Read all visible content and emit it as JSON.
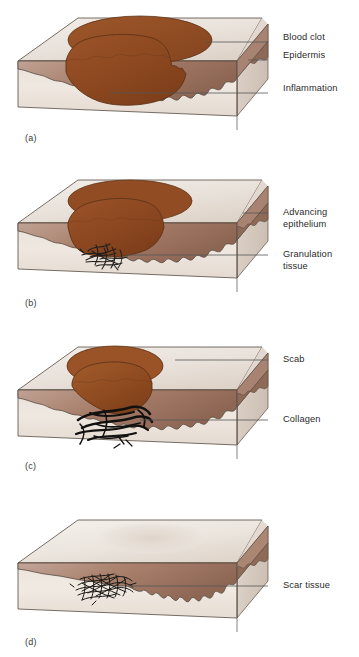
{
  "figure": {
    "width": 359,
    "height": 657,
    "background": "#ffffff"
  },
  "colors": {
    "blood_clot": "#8e4a23",
    "blood_clot_dark": "#7a3d1b",
    "scab": "#9a5326",
    "epidermis_band": "#9b7463",
    "epidermis_band_light": "#c7ada0",
    "dermis": "#e6dcd4",
    "dermis_light": "#f1eae4",
    "top_surface": "#ece7e1",
    "top_surface_shade": "#ded5cc",
    "side_face": "#ddd2c9",
    "outline": "#4a4038",
    "fiber": "#1e1a17",
    "leader_line": "#555555",
    "label_text": "#2b2b2b"
  },
  "panels": [
    {
      "letter": "(a)",
      "letter_x": 25,
      "letter_y": 133,
      "stage": "inflammation",
      "has_clot": true,
      "clot_label": "Blood clot",
      "labels": [
        {
          "text": "Blood clot",
          "x": 283,
          "y": 38,
          "leader_x1": 268,
          "leader_y1": 42,
          "leader_x2": 206,
          "leader_y2": 42
        },
        {
          "text": "Epidermis",
          "x": 283,
          "y": 56,
          "leader_x1": 268,
          "leader_y1": 60,
          "leader_x2": 248,
          "leader_y2": 60
        },
        {
          "text": "Inflammation",
          "x": 283,
          "y": 89,
          "leader_x1": 268,
          "leader_y1": 93,
          "leader_x2": 110,
          "leader_y2": 93
        }
      ]
    },
    {
      "letter": "(b)",
      "letter_x": 25,
      "letter_y": 133,
      "stage": "granulation",
      "has_clot": true,
      "labels": [
        {
          "text": "Advancing\nepithelium",
          "x": 283,
          "y": 44,
          "leader_x1": 268,
          "leader_y1": 48,
          "leader_x2": 243,
          "leader_y2": 48
        },
        {
          "text": "Granulation\ntissue",
          "x": 283,
          "y": 82,
          "leader_x1": 268,
          "leader_y1": 86,
          "leader_x2": 126,
          "leader_y2": 86
        }
      ]
    },
    {
      "letter": "(c)",
      "letter_x": 25,
      "letter_y": 133,
      "stage": "scab-collagen",
      "has_clot": true,
      "labels": [
        {
          "text": "Scab",
          "x": 283,
          "y": 28,
          "leader_x1": 268,
          "leader_y1": 32,
          "leader_x2": 175,
          "leader_y2": 32
        },
        {
          "text": "Collagen",
          "x": 283,
          "y": 78,
          "leader_x1": 268,
          "leader_y1": 82,
          "leader_x2": 140,
          "leader_y2": 82
        }
      ]
    },
    {
      "letter": "(d)",
      "letter_x": 25,
      "letter_y": 144,
      "stage": "scar",
      "has_clot": false,
      "labels": [
        {
          "text": "Scar tissue",
          "x": 283,
          "y": 89,
          "leader_x1": 268,
          "leader_y1": 93,
          "leader_x2": 128,
          "leader_y2": 93
        }
      ]
    }
  ],
  "all_labels": [
    "Blood clot",
    "Epidermis",
    "Inflammation",
    "Advancing epithelium",
    "Granulation tissue",
    "Scab",
    "Collagen",
    "Scar tissue"
  ],
  "panel_letters": [
    "(a)",
    "(b)",
    "(c)",
    "(d)"
  ]
}
